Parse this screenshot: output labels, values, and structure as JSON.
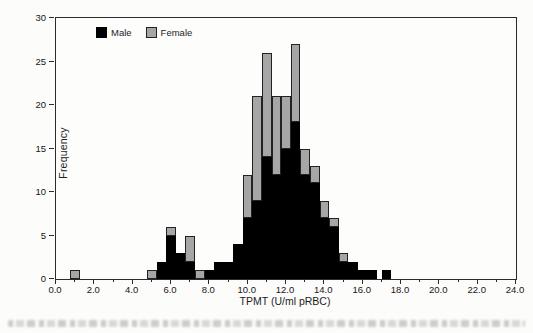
{
  "figure": {
    "xlabel": "TPMT (U/ml pRBC)",
    "ylabel": "Frequency",
    "legend": {
      "male_label": "Male",
      "female_label": "Female"
    },
    "colors": {
      "male": "#000000",
      "female": "#a6a6a6",
      "axis": "#2b2b2b"
    },
    "caption_blurred": true
  },
  "chart_data": {
    "type": "bar",
    "subtype": "stacked-histogram",
    "title": "",
    "xlabel": "TPMT (U/ml pRBC)",
    "ylabel": "Frequency",
    "xlim": [
      0,
      24
    ],
    "ylim": [
      0,
      30
    ],
    "grid": false,
    "bin_width": 0.5,
    "x_tick_labels": [
      "0.0",
      "2.0",
      "4.0",
      "6.0",
      "8.0",
      "10.0",
      "12.0",
      "14.0",
      "16.0",
      "18.0",
      "20.0",
      "22.0",
      "24.0"
    ],
    "x_tick_values": [
      0,
      2,
      4,
      6,
      8,
      10,
      12,
      14,
      16,
      18,
      20,
      22,
      24
    ],
    "x_minor_tick_values": [
      1,
      3,
      5,
      7,
      9,
      11,
      13,
      15,
      17,
      19,
      21,
      23
    ],
    "y_tick_labels": [
      "0",
      "5",
      "10",
      "15",
      "20",
      "25",
      "30"
    ],
    "y_tick_values": [
      0,
      5,
      10,
      15,
      20,
      25,
      30
    ],
    "legend_position": "top-left-inside",
    "series": [
      {
        "name": "Male",
        "color": "#000000"
      },
      {
        "name": "Female",
        "color": "#a6a6a6"
      }
    ],
    "bins": [
      {
        "x": 1.0,
        "male": 0,
        "female": 1
      },
      {
        "x": 5.0,
        "male": 0,
        "female": 1
      },
      {
        "x": 5.5,
        "male": 2,
        "female": 0
      },
      {
        "x": 6.0,
        "male": 5,
        "female": 1
      },
      {
        "x": 6.5,
        "male": 3,
        "female": 0
      },
      {
        "x": 7.0,
        "male": 2,
        "female": 3
      },
      {
        "x": 7.5,
        "male": 0,
        "female": 1
      },
      {
        "x": 8.0,
        "male": 1,
        "female": 0
      },
      {
        "x": 8.5,
        "male": 2,
        "female": 0
      },
      {
        "x": 9.0,
        "male": 2,
        "female": 0
      },
      {
        "x": 9.5,
        "male": 4,
        "female": 0
      },
      {
        "x": 10.0,
        "male": 7,
        "female": 5
      },
      {
        "x": 10.5,
        "male": 9,
        "female": 12
      },
      {
        "x": 11.0,
        "male": 14,
        "female": 12
      },
      {
        "x": 11.5,
        "male": 12,
        "female": 9
      },
      {
        "x": 12.0,
        "male": 15,
        "female": 6
      },
      {
        "x": 12.5,
        "male": 18,
        "female": 9
      },
      {
        "x": 13.0,
        "male": 12,
        "female": 3
      },
      {
        "x": 13.5,
        "male": 11,
        "female": 2
      },
      {
        "x": 14.0,
        "male": 7,
        "female": 2
      },
      {
        "x": 14.5,
        "male": 6,
        "female": 1
      },
      {
        "x": 15.0,
        "male": 2,
        "female": 1
      },
      {
        "x": 15.5,
        "male": 2,
        "female": 0
      },
      {
        "x": 16.0,
        "male": 1,
        "female": 0
      },
      {
        "x": 16.5,
        "male": 1,
        "female": 0
      },
      {
        "x": 17.25,
        "male": 1,
        "female": 0
      }
    ]
  }
}
